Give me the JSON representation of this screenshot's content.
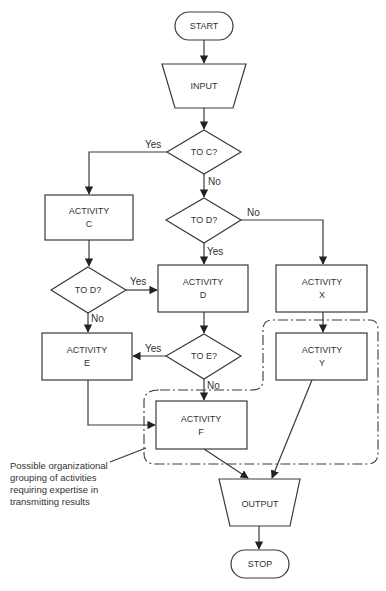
{
  "diagram": {
    "type": "flowchart",
    "nodes": {
      "start": {
        "label": "START",
        "shape": "terminator"
      },
      "input": {
        "label": "INPUT",
        "shape": "manual-input-trapezoid"
      },
      "to_c": {
        "label": "TO C?",
        "shape": "decision"
      },
      "activity_c": {
        "line1": "ACTIVITY",
        "line2": "C",
        "shape": "process"
      },
      "to_d_mid": {
        "label": "TO D?",
        "shape": "decision"
      },
      "to_d_left": {
        "label": "TO D?",
        "shape": "decision"
      },
      "activity_d": {
        "line1": "ACTIVITY",
        "line2": "D",
        "shape": "process"
      },
      "activity_x": {
        "line1": "ACTIVITY",
        "line2": "X",
        "shape": "process"
      },
      "to_e": {
        "label": "TO E?",
        "shape": "decision"
      },
      "activity_e": {
        "line1": "ACTIVITY",
        "line2": "E",
        "shape": "process"
      },
      "activity_y": {
        "line1": "ACTIVITY",
        "line2": "Y",
        "shape": "process"
      },
      "activity_f": {
        "line1": "ACTIVITY",
        "line2": "F",
        "shape": "process"
      },
      "output": {
        "label": "OUTPUT",
        "shape": "trapezoid"
      },
      "stop": {
        "label": "STOP",
        "shape": "terminator"
      }
    },
    "edge_labels": {
      "to_c_yes": "Yes",
      "to_c_no": "No",
      "to_d_mid_no": "No",
      "to_d_mid_yes": "Yes",
      "to_d_left_yes": "Yes",
      "to_d_left_no": "No",
      "to_e_yes": "Yes",
      "to_e_no": "No"
    },
    "edges": [
      {
        "from": "START",
        "to": "INPUT"
      },
      {
        "from": "INPUT",
        "to": "TO C?"
      },
      {
        "from": "TO C?",
        "to": "ACTIVITY C",
        "label": "Yes"
      },
      {
        "from": "TO C?",
        "to": "TO D? (center)",
        "label": "No"
      },
      {
        "from": "TO D? (center)",
        "to": "ACTIVITY X",
        "label": "No"
      },
      {
        "from": "TO D? (center)",
        "to": "ACTIVITY D",
        "label": "Yes"
      },
      {
        "from": "ACTIVITY C",
        "to": "TO D? (left)"
      },
      {
        "from": "TO D? (left)",
        "to": "ACTIVITY D",
        "label": "Yes"
      },
      {
        "from": "TO D? (left)",
        "to": "ACTIVITY E",
        "label": "No"
      },
      {
        "from": "ACTIVITY D",
        "to": "TO E?"
      },
      {
        "from": "TO E?",
        "to": "ACTIVITY E",
        "label": "Yes"
      },
      {
        "from": "TO E?",
        "to": "ACTIVITY F",
        "label": "No"
      },
      {
        "from": "ACTIVITY X",
        "to": "ACTIVITY Y"
      },
      {
        "from": "ACTIVITY E",
        "to": "ACTIVITY F"
      },
      {
        "from": "ACTIVITY F",
        "to": "OUTPUT"
      },
      {
        "from": "ACTIVITY Y",
        "to": "OUTPUT"
      },
      {
        "from": "OUTPUT",
        "to": "STOP"
      }
    ],
    "annotation": {
      "lines": [
        "Possible organizational",
        "grouping of activities",
        "requiring expertise in",
        "transmitting results"
      ],
      "groups": [
        "ACTIVITY F",
        "ACTIVITY Y"
      ]
    }
  }
}
